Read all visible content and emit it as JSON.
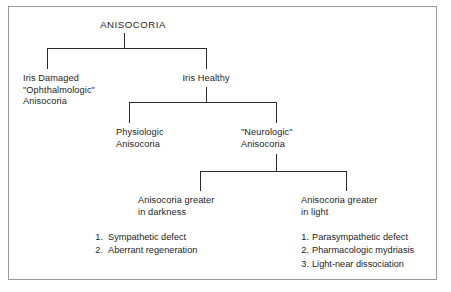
{
  "diagram": {
    "title": "ANISOCORIA",
    "border_color": "#9b9b9b",
    "line_color": "#2b2b2b",
    "background": "#ffffff",
    "nodes": {
      "root": {
        "label": "ANISOCORIA"
      },
      "iris_damaged": {
        "line1": "Iris Damaged",
        "line2": "\"Ophthalmologic\"",
        "line3": "Anisocoria"
      },
      "iris_healthy": {
        "label": "Iris Healthy"
      },
      "physiologic": {
        "line1": "Physiologic",
        "line2": "Anisocoria"
      },
      "neurologic": {
        "line1": "\"Neurologic\"",
        "line2": "Anisocoria"
      },
      "greater_darkness": {
        "line1": "Anisocoria greater",
        "line2": "in darkness"
      },
      "greater_light": {
        "line1": "Anisocoria greater",
        "line2": "in light"
      }
    },
    "darkness_causes": [
      {
        "num": "1.",
        "text": "Sympathetic defect"
      },
      {
        "num": "2.",
        "text": "Aberrant regeneration"
      }
    ],
    "light_causes": [
      {
        "num": "1.",
        "text": "Parasympathetic defect"
      },
      {
        "num": "2.",
        "text": "Pharmacologic mydriasis"
      },
      {
        "num": "3.",
        "text": "Light-near dissociation"
      }
    ]
  }
}
